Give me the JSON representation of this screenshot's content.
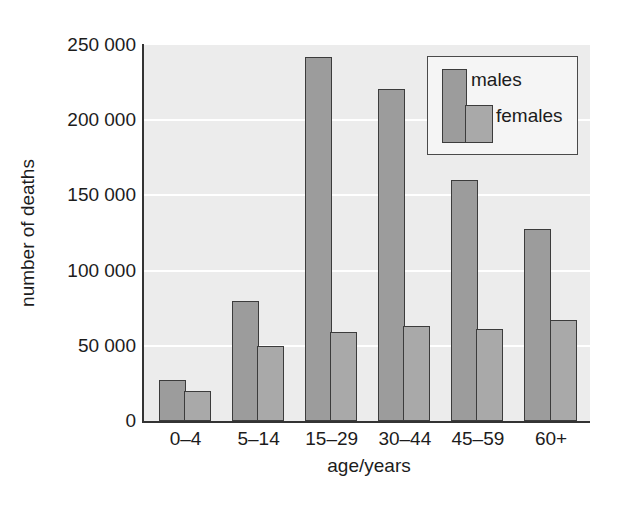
{
  "chart_data": {
    "type": "bar",
    "title": "",
    "xlabel": "age/years",
    "ylabel": "number of deaths",
    "categories": [
      "0–4",
      "5–14",
      "15–29",
      "30–44",
      "45–59",
      "60+"
    ],
    "series": [
      {
        "name": "males",
        "color": "#9c9c9c",
        "values": [
          27000,
          80000,
          242000,
          221000,
          160000,
          128000
        ]
      },
      {
        "name": "females",
        "color": "#a9a9a9",
        "values": [
          20000,
          50000,
          59000,
          63000,
          61000,
          67000
        ]
      }
    ],
    "ylim": [
      0,
      250000
    ],
    "yticks": [
      {
        "label": "0",
        "value": 0
      },
      {
        "label": "50 000",
        "value": 50000
      },
      {
        "label": "100 000",
        "value": 100000
      },
      {
        "label": "150 000",
        "value": 150000
      },
      {
        "label": "200 000",
        "value": 200000
      },
      {
        "label": "250 000",
        "value": 250000
      }
    ],
    "grid": true,
    "legend_position": "top-right"
  },
  "colors": {
    "plot_background": "#ececec",
    "gridline": "#ffffff",
    "axis": "#333333",
    "bar_outline": "#3c3c3c",
    "legend_background": "#f5f5f5",
    "legend_border": "#4a4a4a",
    "text": "#1c1c1c"
  }
}
